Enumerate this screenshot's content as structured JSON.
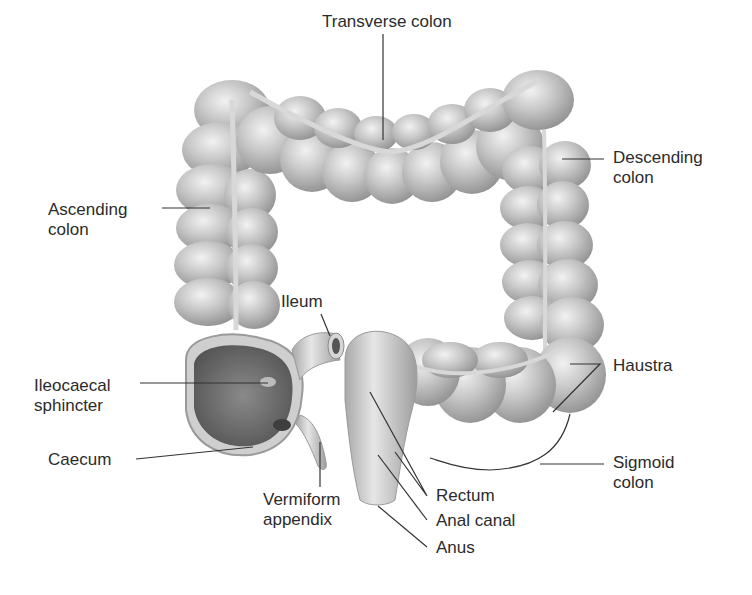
{
  "diagram": {
    "colors": {
      "background": "#ffffff",
      "tissue_light": "#e2e2e2",
      "tissue_mid": "#b9b9b9",
      "tissue_dark": "#8a8a8a",
      "interior": "#6e6e6e",
      "leader_line": "#333333",
      "text": "#2b2b2b"
    },
    "labels": [
      {
        "id": "transverse-colon",
        "text": "Transverse colon",
        "x": 322,
        "y": 12
      },
      {
        "id": "descending-colon",
        "text": "Descending\ncolon",
        "x": 613,
        "y": 148
      },
      {
        "id": "ascending-colon",
        "text": "Ascending\ncolon",
        "x": 48,
        "y": 200
      },
      {
        "id": "ileum",
        "text": "Ileum",
        "x": 281,
        "y": 292
      },
      {
        "id": "ileocaecal-sphincter",
        "text": "Ileocaecal\nsphincter",
        "x": 34,
        "y": 376
      },
      {
        "id": "haustra",
        "text": "Haustra",
        "x": 613,
        "y": 356
      },
      {
        "id": "caecum",
        "text": "Caecum",
        "x": 48,
        "y": 450
      },
      {
        "id": "sigmoid-colon",
        "text": "Sigmoid\ncolon",
        "x": 613,
        "y": 453
      },
      {
        "id": "vermiform-appendix",
        "text": "Vermiform\nappendix",
        "x": 263,
        "y": 490
      },
      {
        "id": "rectum",
        "text": "Rectum",
        "x": 436,
        "y": 486
      },
      {
        "id": "anal-canal",
        "text": "Anal canal",
        "x": 436,
        "y": 511
      },
      {
        "id": "anus",
        "text": "Anus",
        "x": 436,
        "y": 538
      }
    ]
  }
}
